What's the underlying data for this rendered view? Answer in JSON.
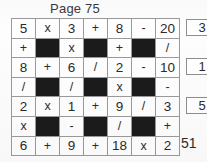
{
  "header": {
    "title": "Page 75"
  },
  "puzzle": {
    "rows": 7,
    "cols": 7,
    "grid": [
      [
        {
          "text": "5",
          "kind": "num"
        },
        {
          "text": "x",
          "kind": "op"
        },
        {
          "text": "3",
          "kind": "num"
        },
        {
          "text": "+",
          "kind": "op"
        },
        {
          "text": "8",
          "kind": "num"
        },
        {
          "text": "-",
          "kind": "op"
        },
        {
          "text": "20",
          "kind": "num"
        }
      ],
      [
        {
          "text": "+",
          "kind": "op"
        },
        {
          "text": "",
          "kind": "block"
        },
        {
          "text": "x",
          "kind": "op"
        },
        {
          "text": "",
          "kind": "block"
        },
        {
          "text": "+",
          "kind": "op"
        },
        {
          "text": "",
          "kind": "block"
        },
        {
          "text": "/",
          "kind": "op"
        }
      ],
      [
        {
          "text": "8",
          "kind": "num"
        },
        {
          "text": "+",
          "kind": "op"
        },
        {
          "text": "6",
          "kind": "num"
        },
        {
          "text": "/",
          "kind": "op"
        },
        {
          "text": "2",
          "kind": "num"
        },
        {
          "text": "-",
          "kind": "op"
        },
        {
          "text": "10",
          "kind": "num"
        }
      ],
      [
        {
          "text": "/",
          "kind": "op"
        },
        {
          "text": "",
          "kind": "block"
        },
        {
          "text": "/",
          "kind": "op"
        },
        {
          "text": "",
          "kind": "block"
        },
        {
          "text": "x",
          "kind": "op"
        },
        {
          "text": "",
          "kind": "block"
        },
        {
          "text": "-",
          "kind": "op"
        }
      ],
      [
        {
          "text": "2",
          "kind": "num"
        },
        {
          "text": "x",
          "kind": "op"
        },
        {
          "text": "1",
          "kind": "num"
        },
        {
          "text": "+",
          "kind": "op"
        },
        {
          "text": "9",
          "kind": "num"
        },
        {
          "text": "/",
          "kind": "op"
        },
        {
          "text": "3",
          "kind": "num"
        }
      ],
      [
        {
          "text": "x",
          "kind": "op"
        },
        {
          "text": "",
          "kind": "block"
        },
        {
          "text": "-",
          "kind": "op"
        },
        {
          "text": "",
          "kind": "block"
        },
        {
          "text": "/",
          "kind": "op"
        },
        {
          "text": "",
          "kind": "block"
        },
        {
          "text": "+",
          "kind": "op"
        }
      ],
      [
        {
          "text": "6",
          "kind": "num"
        },
        {
          "text": "+",
          "kind": "op"
        },
        {
          "text": "9",
          "kind": "num"
        },
        {
          "text": "+",
          "kind": "op"
        },
        {
          "text": "18",
          "kind": "num"
        },
        {
          "text": "x",
          "kind": "op"
        },
        {
          "text": "2",
          "kind": "num"
        }
      ]
    ]
  },
  "answers": {
    "row1": "3",
    "row3": "1",
    "row5": "5",
    "row7_total": "51"
  },
  "colors": {
    "paper": "#fdfdfd",
    "grid_line": "#9a9a9a",
    "block_fill": "#1b1b1b",
    "ink": "#2b2b2b"
  }
}
